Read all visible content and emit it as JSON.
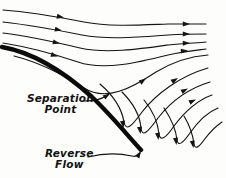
{
  "figure": {
    "domain": "Diagram",
    "background_color": "#fdfdfc",
    "ink_color": "#141414",
    "body_color": "#0b0b0b",
    "width": 226,
    "height": 178
  },
  "labels": {
    "separation": {
      "line1": "Separation",
      "line2": "Point",
      "x": 27,
      "y": 93
    },
    "reverse": {
      "line1": "Reverse",
      "line2": "Flow",
      "x": 45,
      "y": 148
    }
  },
  "chart_data": {
    "type": "line",
    "xlabel": "",
    "ylabel": "",
    "grid": false,
    "legend": "none",
    "xlim": [
      0,
      226
    ],
    "ylim": [
      0,
      178
    ],
    "annotations": [
      {
        "text": "Separation Point",
        "x": 27,
        "y": 93
      },
      {
        "text": "Reverse Flow",
        "x": 45,
        "y": 148
      }
    ],
    "series": [
      {
        "name": "body-surface",
        "role": "wall",
        "stroke_width": 4.4,
        "path": "M 2,47 C 30,52 62,70 92,97 C 112,116 128,136 141,150"
      },
      {
        "name": "streamline-1",
        "role": "freestream",
        "path": "M 3,10 C 30,12 58,17 84,22 C 110,27 140,25 168,24 C 185,24 198,24 206,24",
        "arrows": [
          {
            "x": 64,
            "y": 17.6,
            "angle": 11
          },
          {
            "x": 190,
            "y": 24,
            "angle": 0
          }
        ]
      },
      {
        "name": "streamline-2",
        "role": "freestream",
        "path": "M 3,22 C 30,25 57,30 82,35 C 108,40 140,37 168,35 C 185,34 198,34 206,34",
        "arrows": [
          {
            "x": 62,
            "y": 30.5,
            "angle": 11
          },
          {
            "x": 190,
            "y": 34,
            "angle": 0
          }
        ]
      },
      {
        "name": "streamline-3",
        "role": "freestream",
        "path": "M 3,33 C 28,36 55,42 80,48 C 106,54 140,49 168,45 C 185,43 198,43 206,42",
        "arrows": [
          {
            "x": 60,
            "y": 43.5,
            "angle": 13
          },
          {
            "x": 190,
            "y": 43,
            "angle": -2
          }
        ]
      },
      {
        "name": "streamline-4",
        "role": "freestream",
        "path": "M 3,43 C 28,47 54,54 78,62 C 104,71 140,62 168,55 C 185,51 198,50 206,49",
        "arrows": [
          {
            "x": 58,
            "y": 56.5,
            "angle": 17
          },
          {
            "x": 188,
            "y": 50.5,
            "angle": -5
          }
        ]
      },
      {
        "name": "streamline-5",
        "role": "shear-layer",
        "path": "M 14,56 C 38,62 62,74 84,88 C 106,102 132,88 156,72 C 176,60 194,56 208,55",
        "arrows": [
          {
            "x": 146,
            "y": 78.5,
            "angle": -35
          }
        ]
      },
      {
        "name": "streamline-6",
        "role": "recirculation",
        "path": "M 100,84 C 114,96 122,110 124,122 C 126,132 132,126 142,112 C 156,94 180,76 208,68",
        "arrows": [
          {
            "x": 123.5,
            "y": 128,
            "angle": 82
          },
          {
            "x": 178,
            "y": 78,
            "angle": -32
          }
        ]
      },
      {
        "name": "streamline-7",
        "role": "recirculation",
        "path": "M 122,92 C 134,104 140,116 141,128 C 142,138 148,132 158,118 C 172,100 190,88 210,82",
        "arrows": [
          {
            "x": 140.5,
            "y": 134,
            "angle": 82
          },
          {
            "x": 188,
            "y": 88.5,
            "angle": -28
          }
        ]
      },
      {
        "name": "streamline-8",
        "role": "recirculation",
        "path": "M 144,100 C 154,112 158,124 159,134 C 160,142 166,138 174,126 C 186,110 198,100 212,95",
        "arrows": [
          {
            "x": 158.5,
            "y": 140,
            "angle": 82
          },
          {
            "x": 196,
            "y": 99.5,
            "angle": -25
          }
        ]
      },
      {
        "name": "streamline-9",
        "role": "recirculation",
        "path": "M 164,108 C 172,120 176,130 177,140 C 178,147 183,143 190,133 C 199,120 208,112 218,108",
        "arrows": [
          {
            "x": 176.5,
            "y": 145,
            "angle": 82
          }
        ]
      },
      {
        "name": "streamline-10",
        "role": "recirculation",
        "path": "M 184,116 C 190,126 193,136 194,144 C 195,150 199,147 204,140 C 210,132 216,126 222,122",
        "arrows": [
          {
            "x": 193.5,
            "y": 148,
            "angle": 80
          }
        ]
      }
    ],
    "leaders": [
      {
        "name": "separation-leader",
        "path": "M 84,101 C 94,101 100,100 108,95",
        "arrow": {
          "x": 110,
          "y": 93.5,
          "angle": -34
        }
      },
      {
        "name": "reverse-leader",
        "path": "M 88,157 C 104,153 118,153 132,156 C 136,157 138,156 140,153",
        "arrow": {
          "x": 141,
          "y": 151,
          "angle": -58
        }
      }
    ]
  }
}
